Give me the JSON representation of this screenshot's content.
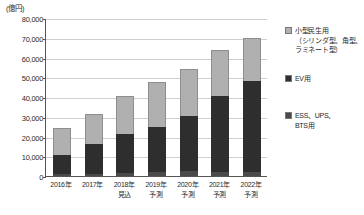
{
  "chart_data": {
    "type": "bar",
    "stacked": true,
    "title": "",
    "subtitle": "",
    "unit_label": "(億円)",
    "xlabel": "",
    "ylabel": "億円",
    "ylim": [
      0,
      80000
    ],
    "ytick_step": 10000,
    "grid": true,
    "legend_position": "right",
    "categories": [
      "2016年",
      "2017年",
      "2018年\n見込",
      "2019年\n予測",
      "2020年\n予測",
      "2021年\n予測",
      "2022年\n予測"
    ],
    "category_lines": [
      [
        "2016年",
        ""
      ],
      [
        "2017年",
        ""
      ],
      [
        "2018年",
        "見込"
      ],
      [
        "2019年",
        "予測"
      ],
      [
        "2020年",
        "予測"
      ],
      [
        "2021年",
        "予測"
      ],
      [
        "2022年",
        "予測"
      ]
    ],
    "ytick_labels": [
      "80,000",
      "70,000",
      "60,000",
      "50,000",
      "40,000",
      "30,000",
      "20,000",
      "10,000",
      "0"
    ],
    "ytick_values": [
      80000,
      70000,
      60000,
      50000,
      40000,
      30000,
      20000,
      10000,
      0
    ],
    "series": [
      {
        "name": "小型民生用（シリンダ型、角型、ラミネート型）",
        "short_name": "小型民生用",
        "color": "#b0b0b0",
        "values": [
          13700,
          15500,
          19000,
          22500,
          23500,
          23500,
          22000
        ]
      },
      {
        "name": "EV用",
        "short_name": "EV用",
        "color": "#2e2e2e",
        "values": [
          9800,
          15000,
          20000,
          23000,
          28000,
          38500,
          46000
        ]
      },
      {
        "name": "ESS、UPS、BTS用",
        "short_name": "ESS、UPS、BTS用",
        "color": "#4a4a4a",
        "values": [
          1000,
          1000,
          1500,
          2000,
          2500,
          2000,
          2000
        ]
      }
    ],
    "totals": [
      24500,
      31500,
      40500,
      47500,
      54000,
      64000,
      70000
    ]
  },
  "legend": {
    "items": [
      {
        "label_line1": "小型民生用",
        "label_line2": "（シリンダ型、角型、",
        "label_line3": "ラミネート型）",
        "swatch": "light-gray"
      },
      {
        "label_line1": "EV用",
        "label_line2": "",
        "label_line3": "",
        "swatch": "dark-gray"
      },
      {
        "label_line1": "ESS、UPS、",
        "label_line2": "BTS用",
        "label_line3": "",
        "swatch": "medium-gray"
      }
    ]
  }
}
